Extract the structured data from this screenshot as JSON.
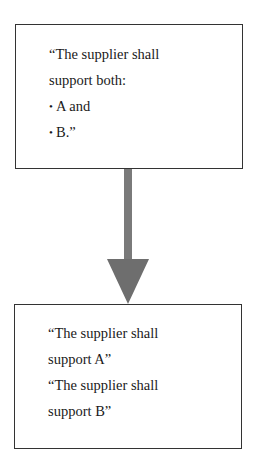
{
  "diagram": {
    "top_box": {
      "lines": [
        {
          "text": "“The supplier shall",
          "bullet": ""
        },
        {
          "text": "support both:",
          "bullet": ""
        },
        {
          "text": "A and",
          "bullet": "•"
        },
        {
          "text": "B.”",
          "bullet": "•"
        }
      ]
    },
    "bottom_box": {
      "lines": [
        {
          "text": "“The supplier shall"
        },
        {
          "text": "support A”"
        },
        {
          "text": "“The supplier shall"
        },
        {
          "text": "support B”"
        }
      ]
    },
    "arrow": {
      "direction": "down",
      "color": "#7a7a7a",
      "icon": "arrow-down-icon"
    },
    "colors": {
      "border": "#333333",
      "text": "#1a1a1a",
      "background": "#ffffff"
    }
  }
}
